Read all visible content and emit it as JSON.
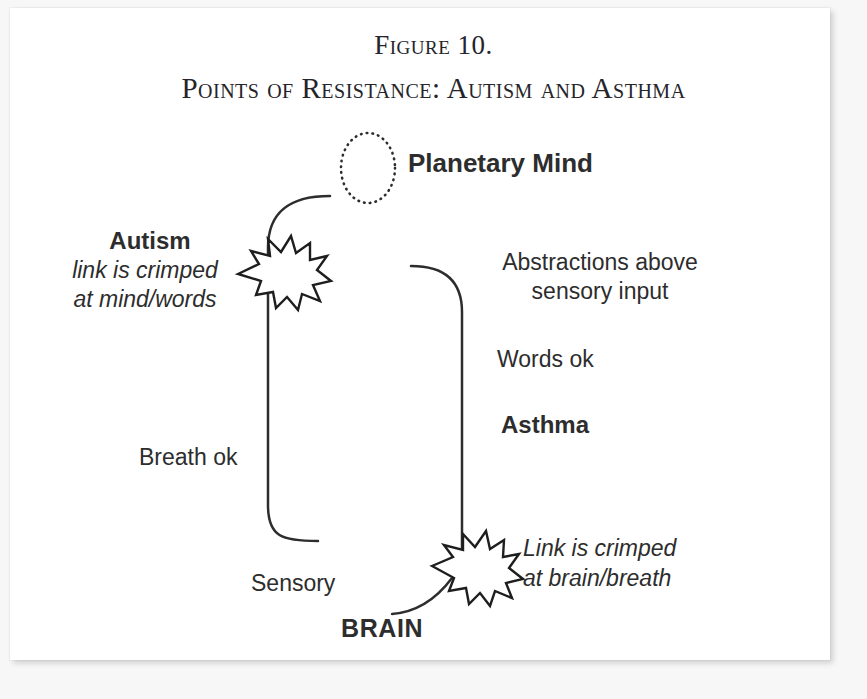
{
  "figure": {
    "title_line1": "Figure 10.",
    "title_line2": "Points of Resistance: Autism and Asthma",
    "ink_color": "#2d2d2d",
    "title_color": "#25242a",
    "page_background": "#ffffff",
    "canvas_background": "#f7f7f7"
  },
  "nodes": {
    "planetary_mind": {
      "label": "Planetary Mind",
      "shape": "dotted-ellipse"
    },
    "brain": {
      "label": "BRAIN"
    }
  },
  "left_branch": {
    "heading": "Autism",
    "note": "link is crimped\nat mind/words",
    "breath_label": "Breath ok",
    "sensory_label": "Sensory",
    "break_marker": "starburst"
  },
  "right_branch": {
    "heading": "Asthma",
    "abstractions_label": "Abstractions above\nsensory input",
    "words_label": "Words ok",
    "note": "Link is crimped\nat brain/breath",
    "break_marker": "starburst"
  }
}
